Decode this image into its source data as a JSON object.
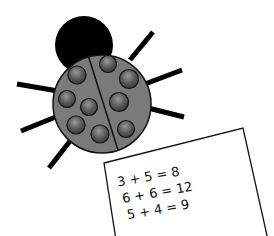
{
  "illustration": {
    "subject": "ladybug",
    "colors": {
      "head": "#000000",
      "body": "#7a7a7a",
      "spot": "#5a5a5a",
      "legs": "#000000",
      "paper": "#ffffff"
    },
    "spots_left": 5,
    "spots_right": 4
  },
  "paper": {
    "equations": [
      "3 + 5 = 8",
      "6 + 6 = 12",
      "5 + 4 = 9"
    ]
  }
}
